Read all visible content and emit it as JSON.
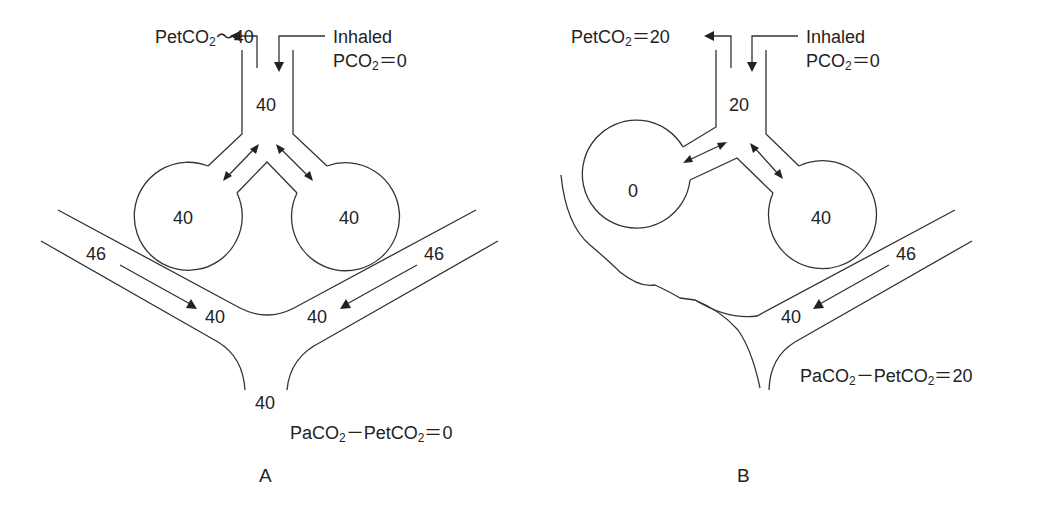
{
  "panels": [
    {
      "id": "A",
      "label": "A",
      "petco2": {
        "prefix": "PetCO",
        "sub": "2",
        "suffix": "～40"
      },
      "inhaled": {
        "line1": "Inhaled",
        "line2_prefix": "PCO",
        "line2_sub": "2",
        "line2_suffix": "＝0"
      },
      "airway_value": "40",
      "left_alveolus": "40",
      "right_alveolus": "40",
      "left_capillary_in": "46",
      "left_capillary_out": "40",
      "right_capillary_in": "46",
      "right_capillary_out": "40",
      "mixed_venous_out": "40",
      "gradient": {
        "a": "PaCO",
        "a_sub": "2",
        "mid": "－PetCO",
        "mid_sub": "2",
        "end": "＝0"
      }
    },
    {
      "id": "B",
      "label": "B",
      "petco2": {
        "prefix": "PetCO",
        "sub": "2",
        "suffix": "＝20"
      },
      "inhaled": {
        "line1": "Inhaled",
        "line2_prefix": "PCO",
        "line2_sub": "2",
        "line2_suffix": "＝0"
      },
      "airway_value": "20",
      "left_alveolus": "0",
      "right_alveolus": "40",
      "right_capillary_in": "46",
      "right_capillary_out": "40",
      "gradient": {
        "a": "PaCO",
        "a_sub": "2",
        "mid": "－PetCO",
        "mid_sub": "2",
        "end": "＝20"
      }
    }
  ]
}
